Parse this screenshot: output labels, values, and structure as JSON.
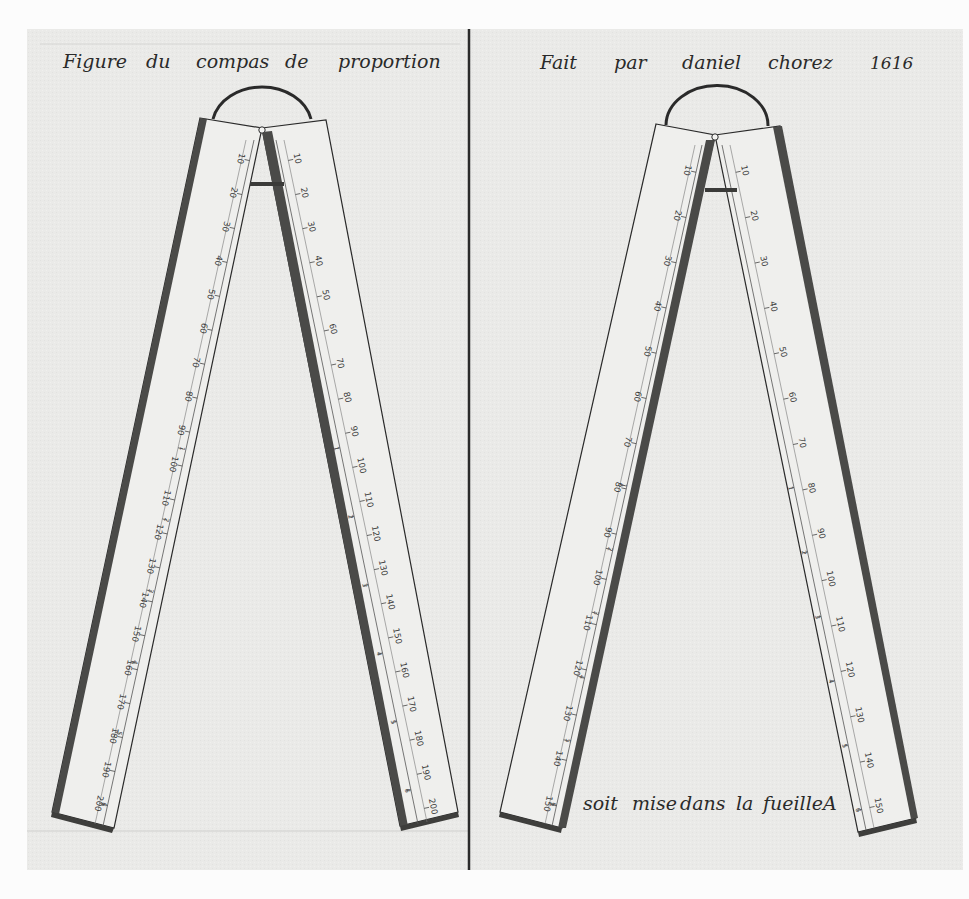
{
  "plate": {
    "paper_color": "#ebebea",
    "ink_color": "#2a2a2a",
    "rod_color": "#4a4a48",
    "arm_color": "#efefed"
  },
  "left_panel": {
    "caption": {
      "words": [
        "Figure",
        "du",
        "compas",
        "de",
        "proportion"
      ]
    },
    "compass": {
      "left_leg_scale_outer": [
        "10",
        "20",
        "30",
        "40",
        "50",
        "60",
        "70",
        "80",
        "90",
        "100",
        "110",
        "120",
        "130",
        "140",
        "150",
        "160",
        "170",
        "180",
        "190",
        "200"
      ],
      "left_leg_scale_inner": [
        "1",
        "2",
        "3",
        "4",
        "5",
        "6"
      ],
      "right_leg_scale_outer": [
        "10",
        "20",
        "30",
        "40",
        "50",
        "60",
        "70",
        "80",
        "90",
        "100",
        "110",
        "120",
        "130",
        "140",
        "150",
        "160",
        "170",
        "180",
        "190",
        "200"
      ],
      "right_leg_scale_inner": [
        "1",
        "2",
        "3",
        "4",
        "5",
        "6"
      ]
    }
  },
  "right_panel": {
    "caption": {
      "words": [
        "Fait",
        "par",
        "daniel",
        "chorez",
        "1616"
      ]
    },
    "compass": {
      "left_leg_scale_outer": [
        "10",
        "20",
        "30",
        "40",
        "50",
        "60",
        "70",
        "80",
        "90",
        "100",
        "110",
        "120",
        "130",
        "140",
        "150"
      ],
      "left_leg_scale_inner": [
        "1",
        "2",
        "3",
        "4",
        "5",
        "6"
      ],
      "right_leg_scale_outer": [
        "10",
        "20",
        "30",
        "40",
        "50",
        "60",
        "70",
        "80",
        "90",
        "100",
        "110",
        "120",
        "130",
        "140",
        "150"
      ],
      "right_leg_scale_inner": [
        "1",
        "2",
        "3",
        "4",
        "5",
        "6"
      ]
    },
    "footer_note": {
      "words": [
        "soit",
        "mise",
        "dans",
        "la",
        "fueille",
        "A"
      ]
    }
  }
}
